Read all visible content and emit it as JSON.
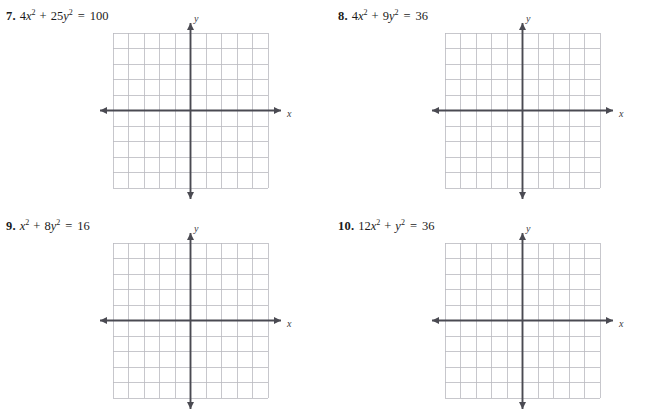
{
  "page": {
    "kind": "math-worksheet",
    "background_color": "#ffffff",
    "text_color": "#1a1a1a"
  },
  "graph_style": {
    "grid_color": "#b9b9bf",
    "axis_color": "#4a4a52",
    "grid_cells_x": 10,
    "grid_cells_y": 10,
    "axis_label_x": "x",
    "axis_label_y": "y"
  },
  "problems": [
    {
      "number": "7.",
      "equation_plain": "4x² + 25y² = 100",
      "terms": [
        {
          "coef": "4",
          "var": "x",
          "exp": "2"
        },
        {
          "coef": "25",
          "var": "y",
          "exp": "2"
        }
      ],
      "operator": "+",
      "equals": "=",
      "rhs": "100",
      "graph": {
        "axis_label_x": "x",
        "axis_label_y": "y",
        "cells_x": 10,
        "cells_y": 10
      }
    },
    {
      "number": "8.",
      "equation_plain": "4x² + 9y² = 36",
      "terms": [
        {
          "coef": "4",
          "var": "x",
          "exp": "2"
        },
        {
          "coef": "9",
          "var": "y",
          "exp": "2"
        }
      ],
      "operator": "+",
      "equals": "=",
      "rhs": "36",
      "graph": {
        "axis_label_x": "x",
        "axis_label_y": "y",
        "cells_x": 10,
        "cells_y": 10
      }
    },
    {
      "number": "9.",
      "equation_plain": "x² + 8y² = 16",
      "terms": [
        {
          "coef": "",
          "var": "x",
          "exp": "2"
        },
        {
          "coef": "8",
          "var": "y",
          "exp": "2"
        }
      ],
      "operator": "+",
      "equals": "=",
      "rhs": "16",
      "graph": {
        "axis_label_x": "x",
        "axis_label_y": "y",
        "cells_x": 10,
        "cells_y": 10
      }
    },
    {
      "number": "10.",
      "equation_plain": "12x² + y² = 36",
      "terms": [
        {
          "coef": "12",
          "var": "x",
          "exp": "2"
        },
        {
          "coef": "",
          "var": "y",
          "exp": "2"
        }
      ],
      "operator": "+",
      "equals": "=",
      "rhs": "36",
      "graph": {
        "axis_label_x": "x",
        "axis_label_y": "y",
        "cells_x": 10,
        "cells_y": 10
      }
    }
  ]
}
